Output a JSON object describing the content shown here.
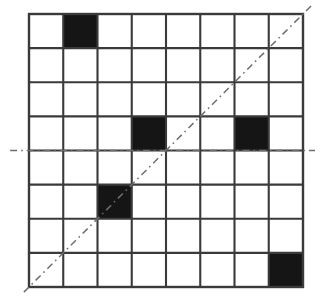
{
  "figure": {
    "title": "",
    "background_color": "#ffffff"
  },
  "chart_data": {
    "type": "heatmap",
    "title": "",
    "xlabel": "",
    "ylabel": "",
    "grid": true,
    "legend": "none",
    "rows": 8,
    "cols": 8,
    "xlim": [
      0,
      8
    ],
    "ylim": [
      0,
      8
    ],
    "xticklabels": [
      "",
      "",
      "",
      "",
      "",
      "",
      "",
      ""
    ],
    "yticklabels": [
      "",
      "",
      "",
      "",
      "",
      "",
      "",
      ""
    ],
    "values": [
      [
        0,
        1,
        0,
        0,
        0,
        0,
        0,
        0
      ],
      [
        0,
        0,
        0,
        0,
        0,
        0,
        0,
        0
      ],
      [
        0,
        0,
        0,
        0,
        0,
        0,
        0,
        0
      ],
      [
        0,
        0,
        0,
        1,
        0,
        0,
        1,
        0
      ],
      [
        0,
        0,
        0,
        0,
        0,
        0,
        0,
        0
      ],
      [
        0,
        0,
        1,
        0,
        0,
        0,
        0,
        0
      ],
      [
        0,
        0,
        0,
        0,
        0,
        0,
        0,
        0
      ],
      [
        0,
        0,
        0,
        0,
        0,
        0,
        0,
        1
      ]
    ],
    "filled_cells": [
      {
        "row": 0,
        "col": 1
      },
      {
        "row": 3,
        "col": 3
      },
      {
        "row": 3,
        "col": 6
      },
      {
        "row": 5,
        "col": 2
      },
      {
        "row": 7,
        "col": 7
      }
    ],
    "colors": {
      "filled": "#151515",
      "empty": "#ffffff",
      "gridline": "#3a3a3a",
      "dashed_line": "#6e6e6e"
    },
    "annotations": [
      {
        "name": "diagonal-dashed-line",
        "style": "dash-dot",
        "from": [
          -0.15,
          -0.15
        ],
        "to": [
          8.3,
          8.3
        ]
      },
      {
        "name": "horizontal-dashed-line",
        "style": "dash-dot",
        "from": [
          -0.55,
          4.0
        ],
        "to": [
          8.35,
          4.0
        ]
      }
    ]
  },
  "geometry": {
    "grid_left": 29,
    "grid_top": 14,
    "grid_right": 303,
    "grid_bottom": 287,
    "cell_width": 34.25,
    "cell_height": 34.125
  }
}
